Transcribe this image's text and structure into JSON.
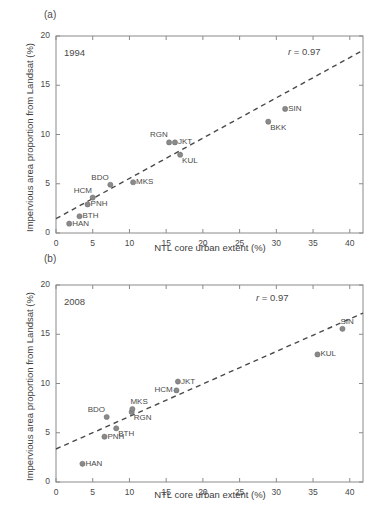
{
  "figure": {
    "background": "#ffffff",
    "point_color": "#8a8a8a",
    "line_color": "#4a4a4a",
    "axis_color": "#8a8a8a"
  },
  "axes": {
    "xlabel": "NTL core urban extent (%)",
    "ylabel": "Impervious area proportion from Landsat (%)",
    "xticks": [
      "0",
      "5",
      "10",
      "15",
      "20",
      "25",
      "30",
      "35",
      "40"
    ],
    "yticks": [
      "0",
      "5",
      "10",
      "15",
      "20"
    ],
    "xlim": [
      0,
      41.8
    ],
    "ylim": [
      0,
      20
    ]
  },
  "panels": [
    {
      "letter": "(a)",
      "year": "1994",
      "r_prefix": "r",
      "r_text": " = 0.97"
    },
    {
      "letter": "(b)",
      "year": "2008",
      "r_prefix": "r",
      "r_text": " = 0.97"
    }
  ],
  "chart_data": [
    {
      "type": "scatter",
      "title": "1994",
      "panel": "(a)",
      "xlabel": "NTL core urban extent (%)",
      "ylabel": "Impervious area proportion from Landsat (%)",
      "xlim": [
        0,
        41.8
      ],
      "ylim": [
        0,
        20
      ],
      "xticks": [
        0,
        5,
        10,
        15,
        20,
        25,
        30,
        35,
        40
      ],
      "yticks": [
        0,
        5,
        10,
        15,
        20
      ],
      "grid": false,
      "legend": "none",
      "annotation": "r = 0.97",
      "correlation_r": 0.97,
      "points": [
        {
          "label": "HAN",
          "x": 1.8,
          "y": 0.95,
          "label_pos": "right"
        },
        {
          "label": "BTH",
          "x": 3.2,
          "y": 1.7,
          "label_pos": "right"
        },
        {
          "label": "PNH",
          "x": 4.3,
          "y": 2.9,
          "label_pos": "right"
        },
        {
          "label": "HCM",
          "x": 5.0,
          "y": 3.6,
          "label_pos": "upleft"
        },
        {
          "label": "BDO",
          "x": 7.4,
          "y": 4.9,
          "label_pos": "upleft"
        },
        {
          "label": "MKS",
          "x": 10.5,
          "y": 5.15,
          "label_pos": "right"
        },
        {
          "label": "RGN",
          "x": 15.4,
          "y": 9.2,
          "label_pos": "upleft"
        },
        {
          "label": "JKT",
          "x": 16.2,
          "y": 9.2,
          "label_pos": "right"
        },
        {
          "label": "KUL",
          "x": 16.9,
          "y": 7.95,
          "label_pos": "downright"
        },
        {
          "label": "BKK",
          "x": 28.9,
          "y": 11.3,
          "label_pos": "downright"
        },
        {
          "label": "SIN",
          "x": 31.2,
          "y": 12.6,
          "label_pos": "right"
        }
      ],
      "fit_line": {
        "x0": 0,
        "y0": 1.45,
        "x1": 41.8,
        "y1": 18.55,
        "style": "dashed"
      }
    },
    {
      "type": "scatter",
      "title": "2008",
      "panel": "(b)",
      "xlabel": "NTL core urban extent (%)",
      "ylabel": "Impervious area proportion from Landsat (%)",
      "xlim": [
        0,
        41.8
      ],
      "ylim": [
        0,
        20
      ],
      "xticks": [
        0,
        5,
        10,
        15,
        20,
        25,
        30,
        35,
        40
      ],
      "yticks": [
        0,
        5,
        10,
        15,
        20
      ],
      "grid": false,
      "legend": "none",
      "annotation": "r = 0.97",
      "correlation_r": 0.97,
      "points": [
        {
          "label": "HAN",
          "x": 3.6,
          "y": 1.85,
          "label_pos": "right"
        },
        {
          "label": "PNH",
          "x": 6.6,
          "y": 4.6,
          "label_pos": "right"
        },
        {
          "label": "BDO",
          "x": 6.9,
          "y": 6.6,
          "label_pos": "upleft"
        },
        {
          "label": "BTH",
          "x": 8.2,
          "y": 5.45,
          "label_pos": "downright"
        },
        {
          "label": "RGN",
          "x": 10.3,
          "y": 7.1,
          "label_pos": "downright"
        },
        {
          "label": "MKS",
          "x": 10.4,
          "y": 7.4,
          "label_pos": "upright"
        },
        {
          "label": "HCM",
          "x": 16.4,
          "y": 9.3,
          "label_pos": "left"
        },
        {
          "label": "JKT",
          "x": 16.6,
          "y": 10.2,
          "label_pos": "right"
        },
        {
          "label": "KUL",
          "x": 35.6,
          "y": 12.95,
          "label_pos": "right"
        },
        {
          "label": "SIN",
          "x": 39.0,
          "y": 15.55,
          "label_pos": "upright"
        },
        {
          "label": "BKK",
          "x": 42.8,
          "y": 16.85,
          "label_pos": "upright"
        }
      ],
      "fit_line": {
        "x0": 0,
        "y0": 3.35,
        "x1": 41.8,
        "y1": 17.15,
        "style": "dashed"
      }
    }
  ]
}
